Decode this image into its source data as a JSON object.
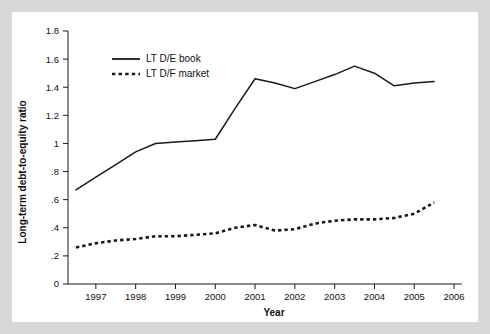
{
  "chart_data": {
    "type": "line",
    "title": "",
    "xlabel": "Year",
    "ylabel": "Long-term debt-to-equity ratio",
    "xlim": [
      1996.3,
      2006.2
    ],
    "ylim": [
      0,
      1.8
    ],
    "grid": false,
    "legend_position": "top-left inside plot",
    "x_tick_labels": [
      "1997",
      "1998",
      "1999",
      "2000",
      "2001",
      "2002",
      "2003",
      "2004",
      "2005",
      "2006"
    ],
    "x_ticks": [
      1997,
      1998,
      1999,
      2000,
      2001,
      2002,
      2003,
      2004,
      2005,
      2006
    ],
    "y_tick_labels": [
      "0",
      ".2",
      ".4",
      ".6",
      ".8",
      "1",
      "1.2",
      "1.4",
      "1.6",
      "1.8"
    ],
    "y_ticks": [
      0,
      0.2,
      0.4,
      0.6,
      0.8,
      1.0,
      1.2,
      1.4,
      1.6,
      1.8
    ],
    "x": [
      1996.5,
      1997.0,
      1997.5,
      1998.0,
      1998.5,
      1999.0,
      1999.5,
      2000.0,
      2000.5,
      2001.0,
      2001.5,
      2002.0,
      2002.5,
      2003.0,
      2003.5,
      2004.0,
      2004.5,
      2005.0,
      2005.5
    ],
    "series": [
      {
        "name": "LT D/E book",
        "style": "solid",
        "color": "#1a1a1a",
        "values": [
          0.67,
          0.76,
          0.85,
          0.94,
          1.0,
          1.01,
          1.02,
          1.03,
          1.25,
          1.46,
          1.43,
          1.39,
          1.44,
          1.49,
          1.55,
          1.5,
          1.41,
          1.43,
          1.44
        ]
      },
      {
        "name": "LT D/F market",
        "style": "dashed",
        "color": "#1a1a1a",
        "values": [
          0.26,
          0.29,
          0.31,
          0.32,
          0.34,
          0.34,
          0.35,
          0.36,
          0.4,
          0.42,
          0.38,
          0.39,
          0.43,
          0.45,
          0.46,
          0.46,
          0.47,
          0.5,
          0.58
        ]
      }
    ],
    "legend": [
      {
        "label": "LT D/E book",
        "style": "solid"
      },
      {
        "label": "LT D/F market",
        "style": "dashed"
      }
    ]
  }
}
